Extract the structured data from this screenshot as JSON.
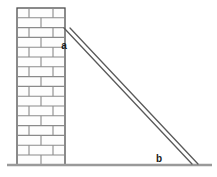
{
  "scene": {
    "title": "Ladder leaning against a brick wall",
    "background_color": "#ffffff",
    "width": 217,
    "height": 177
  },
  "wall": {
    "name": "brick-wall",
    "x": 17,
    "y": 8,
    "width": 48,
    "height": 157,
    "outline_color": "#4d4d4d",
    "mortar_color": "#808080",
    "brick_fill": "#fdfdfd",
    "rows": 16,
    "row_height": 9.8,
    "label": "brick wall"
  },
  "ground": {
    "name": "ground-line",
    "x1": 7,
    "x2": 212,
    "y": 165,
    "color": "#9a9a9a",
    "thickness": 2.4,
    "label": "ground"
  },
  "ladder": {
    "name": "ladder",
    "top_x": 64,
    "top_y": 28,
    "bottom_x": 197,
    "bottom_y": 164,
    "rail_offset": 6,
    "color": "#5a5a5a",
    "thickness": 1.4,
    "label": "ladder"
  },
  "labels": {
    "top_point": {
      "text": "a",
      "x": 64,
      "y": 49,
      "description": "top contact point of ladder on wall"
    },
    "bottom_point": {
      "text": "b",
      "x": 159,
      "y": 162,
      "description": "bottom contact point of ladder on ground"
    }
  },
  "colors": {
    "stroke": "#4d4d4d",
    "mortar": "#808080",
    "ground": "#9a9a9a",
    "ladder": "#5a5a5a",
    "label": "#1a1a1a"
  }
}
